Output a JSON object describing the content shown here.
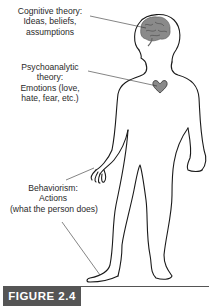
{
  "figure": {
    "label": "FIGURE 2.4",
    "badge_color": "#555555"
  },
  "annotations": {
    "cognitive": {
      "lines": [
        "Cognitive theory:",
        "Ideas, beliefs,",
        "assumptions"
      ],
      "target": "brain"
    },
    "psychoanalytic": {
      "lines": [
        "Psychoanalytic",
        "theory:",
        "Emotions (love,",
        "hate, fear, etc.)"
      ],
      "target": "heart"
    },
    "behaviorism": {
      "lines": [
        "Behaviorism:",
        "Actions",
        "(what the person does)"
      ],
      "target": "hand-and-foot"
    }
  },
  "colors": {
    "outline": "#1a1a1a",
    "organ_fill": "#8a8a8a",
    "leader_line": "#333333"
  }
}
